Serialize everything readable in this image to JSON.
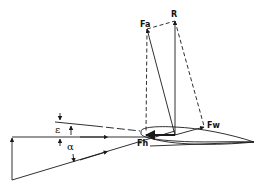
{
  "diagram": {
    "type": "airfoil force diagram",
    "labels": {
      "fa": "Fa",
      "r": "R",
      "fw": "Fw",
      "fh": "Fh",
      "epsilon": "ε",
      "alpha": "α"
    },
    "colors": {
      "stroke": "#1a1a1a",
      "background": "#ffffff"
    }
  }
}
